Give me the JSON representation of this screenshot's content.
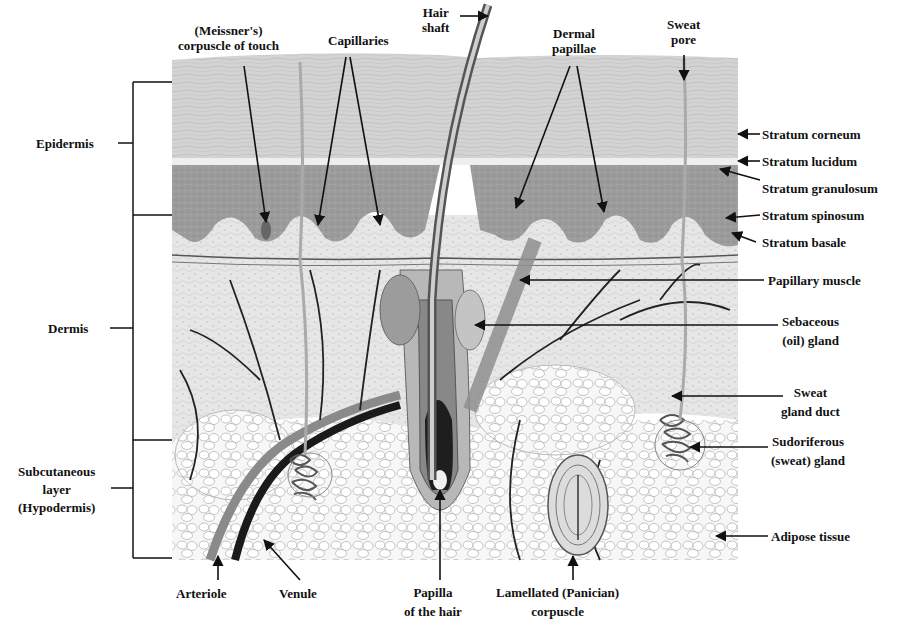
{
  "colors": {
    "background": "#ffffff",
    "ink": "#111111",
    "corneum": "#cfcfcf",
    "granulosum": "#9a9a9a",
    "dermis": "#e4e4e4",
    "adipose": "#f4f4f4",
    "vessel_dark": "#1a1a1a",
    "vessel_mid": "#7a7a7a"
  },
  "layers": [
    {
      "id": "epidermis",
      "label": "Epidermis"
    },
    {
      "id": "dermis",
      "label": "Dermis"
    },
    {
      "id": "hypodermis",
      "label_line1": "Subcutaneous",
      "label_line2": "layer",
      "label_line3": "(Hypodermis)"
    }
  ],
  "top_labels": {
    "meissner": {
      "line1": "(Meissner's)",
      "line2": "corpuscle of touch"
    },
    "capillaries": "Capillaries",
    "hair_shaft": {
      "line1": "Hair",
      "line2": "shaft"
    },
    "dermal_papillae": {
      "line1": "Dermal",
      "line2": "papillae"
    },
    "sweat_pore": {
      "line1": "Sweat",
      "line2": "pore"
    }
  },
  "right_labels": {
    "stratum_corneum": "Stratum corneum",
    "stratum_lucidum": "Stratum lucidum",
    "stratum_granulosum": "Stratum granulosum",
    "stratum_spinosum": "Stratum spinosum",
    "stratum_basale": "Stratum basale",
    "papillary_muscle": "Papillary muscle",
    "sebaceous": {
      "line1": "Sebaceous",
      "line2": "(oil) gland"
    },
    "sweat_duct": {
      "line1": "Sweat",
      "line2": "gland duct"
    },
    "sudoriferous": {
      "line1": "Sudoriferous",
      "line2": "(sweat) gland"
    },
    "adipose": "Adipose tissue"
  },
  "bottom_labels": {
    "arteriole": "Arteriole",
    "venule": "Venule",
    "papilla": {
      "line1": "Papilla",
      "line2": "of the hair"
    },
    "lamellated": {
      "line1": "Lamellated (Panician)",
      "line2": "corpuscle"
    }
  }
}
